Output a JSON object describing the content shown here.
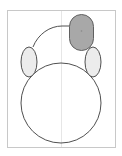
{
  "diagram": {
    "type": "shape-drawing",
    "frame": {
      "stroke": "#c8c8c8",
      "fill": "#ffffff"
    },
    "guide_line": {
      "stroke": "#e6e6e6"
    },
    "outline": {
      "stroke": "#505050",
      "fill": "#ffffff"
    },
    "ears": {
      "stroke": "#505050",
      "fill": "#ececec"
    },
    "capsule": {
      "stroke": "#606060",
      "fill": "#a8a8a8",
      "selected": true
    }
  }
}
